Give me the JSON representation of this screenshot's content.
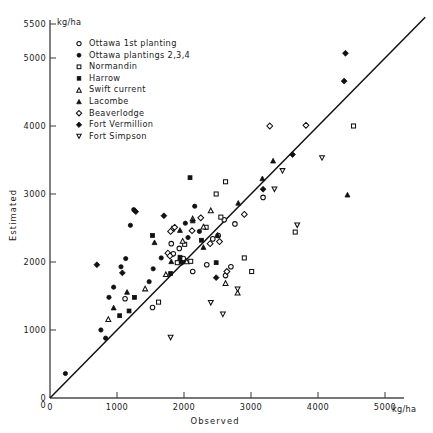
{
  "figure": {
    "title": "",
    "units_y": "kg/ha",
    "units_x": "kg/ha"
  },
  "axes": {
    "x_title": "Observed",
    "y_title": "Estimated",
    "x_ticks": [
      "0",
      "1000",
      "2000",
      "3000",
      "4000",
      "5000"
    ],
    "y_ticks": [
      "0",
      "1000",
      "2000",
      "3000",
      "4000",
      "5000",
      "5500"
    ],
    "origin_label": "0"
  },
  "legend": {
    "items": [
      {
        "label": "Ottawa 1st planting",
        "marker": "circle-open"
      },
      {
        "label": "Ottawa plantings  2,3,4",
        "marker": "circle-filled"
      },
      {
        "label": "Normandin",
        "marker": "square-open"
      },
      {
        "label": "Harrow",
        "marker": "square-filled"
      },
      {
        "label": "Swift current",
        "marker": "triangle-open"
      },
      {
        "label": "Lacombe",
        "marker": "triangle-filled"
      },
      {
        "label": "Beaverlodge",
        "marker": "diamond-open"
      },
      {
        "label": "Fort Vermillion",
        "marker": "diamond-filled"
      },
      {
        "label": "Fort Simpson",
        "marker": "triangle-down-open"
      }
    ]
  },
  "chart_data": {
    "type": "scatter",
    "title": "",
    "xlabel": "Observed",
    "ylabel": "Estimated",
    "xunit": "kg/ha",
    "yunit": "kg/ha",
    "xlim": [
      0,
      5750
    ],
    "ylim": [
      0,
      5500
    ],
    "grid": false,
    "legend_position": "top-left-inside",
    "reference_line": {
      "name": "1:1 line",
      "from": [
        0,
        0
      ],
      "to": [
        5600,
        5600
      ],
      "style": "solid"
    },
    "series": [
      {
        "name": "Ottawa 1st planting",
        "marker": "circle-open",
        "points": [
          [
            1120,
            1460
          ],
          [
            1530,
            1330
          ],
          [
            1810,
            2270
          ],
          [
            1930,
            2200
          ],
          [
            1990,
            2050
          ],
          [
            2130,
            1860
          ],
          [
            2340,
            1960
          ],
          [
            2430,
            2340
          ],
          [
            2510,
            2390
          ],
          [
            2600,
            2620
          ],
          [
            2620,
            1800
          ],
          [
            2700,
            1930
          ],
          [
            2760,
            2560
          ],
          [
            3180,
            2950
          ],
          [
            1840,
            2120
          ]
        ]
      },
      {
        "name": "Ottawa plantings  2,3,4",
        "marker": "circle-filled",
        "points": [
          [
            230,
            360
          ],
          [
            760,
            1000
          ],
          [
            830,
            880
          ],
          [
            880,
            1480
          ],
          [
            950,
            1630
          ],
          [
            1060,
            1930
          ],
          [
            1130,
            2050
          ],
          [
            1200,
            2540
          ],
          [
            1250,
            2770
          ],
          [
            1480,
            1710
          ],
          [
            1540,
            1900
          ],
          [
            1660,
            2060
          ],
          [
            1930,
            2010
          ],
          [
            2020,
            2570
          ],
          [
            2060,
            2360
          ],
          [
            2160,
            2820
          ],
          [
            2230,
            2450
          ]
        ]
      },
      {
        "name": "Normandin",
        "marker": "square-open",
        "points": [
          [
            1620,
            1410
          ],
          [
            1900,
            1990
          ],
          [
            2100,
            2010
          ],
          [
            2330,
            2510
          ],
          [
            2480,
            3000
          ],
          [
            2550,
            2660
          ],
          [
            2620,
            3180
          ],
          [
            2900,
            2060
          ],
          [
            3010,
            1860
          ],
          [
            3660,
            2440
          ],
          [
            4530,
            4000
          ],
          [
            2010,
            2260
          ]
        ]
      },
      {
        "name": "Harrow",
        "marker": "square-filled",
        "points": [
          [
            1040,
            1210
          ],
          [
            1180,
            1280
          ],
          [
            1260,
            1480
          ],
          [
            1530,
            2390
          ],
          [
            1800,
            1830
          ],
          [
            1940,
            2070
          ],
          [
            2090,
            3240
          ],
          [
            2260,
            2320
          ],
          [
            2480,
            1990
          ]
        ]
      },
      {
        "name": "Swift current",
        "marker": "triangle-open",
        "points": [
          [
            870,
            1160
          ],
          [
            1420,
            1610
          ],
          [
            1730,
            1820
          ],
          [
            1820,
            2490
          ],
          [
            1980,
            2310
          ],
          [
            2040,
            2010
          ],
          [
            2130,
            2640
          ],
          [
            2290,
            2520
          ],
          [
            2400,
            2760
          ],
          [
            2620,
            1690
          ],
          [
            2800,
            1550
          ]
        ]
      },
      {
        "name": "Lacombe",
        "marker": "triangle-filled",
        "points": [
          [
            950,
            1330
          ],
          [
            1150,
            1560
          ],
          [
            1560,
            2290
          ],
          [
            1810,
            2010
          ],
          [
            1940,
            2470
          ],
          [
            2130,
            2610
          ],
          [
            2290,
            2220
          ],
          [
            2500,
            2400
          ],
          [
            2810,
            2870
          ],
          [
            3170,
            3230
          ],
          [
            3330,
            3490
          ],
          [
            4440,
            2990
          ]
        ]
      },
      {
        "name": "Beaverlodge",
        "marker": "diamond-open",
        "points": [
          [
            1760,
            2130
          ],
          [
            1790,
            2090
          ],
          [
            1800,
            2450
          ],
          [
            1860,
            2510
          ],
          [
            2120,
            2460
          ],
          [
            2250,
            2650
          ],
          [
            2390,
            2270
          ],
          [
            2530,
            2300
          ],
          [
            2640,
            1860
          ],
          [
            2900,
            2700
          ],
          [
            3280,
            4000
          ],
          [
            3820,
            4010
          ]
        ]
      },
      {
        "name": "Fort Vermillion",
        "marker": "diamond-filled",
        "points": [
          [
            700,
            1960
          ],
          [
            1080,
            1840
          ],
          [
            1280,
            2740
          ],
          [
            1700,
            2680
          ],
          [
            1970,
            1990
          ],
          [
            2480,
            1770
          ],
          [
            3180,
            3070
          ],
          [
            3620,
            3580
          ],
          [
            4390,
            4660
          ],
          [
            4410,
            5070
          ]
        ]
      },
      {
        "name": "Fort Simpson",
        "marker": "triangle-down-open",
        "points": [
          [
            1800,
            890
          ],
          [
            2400,
            1400
          ],
          [
            2580,
            1230
          ],
          [
            2800,
            1600
          ],
          [
            3350,
            3070
          ],
          [
            3470,
            3340
          ],
          [
            3690,
            2540
          ],
          [
            4060,
            3530
          ]
        ]
      }
    ]
  }
}
